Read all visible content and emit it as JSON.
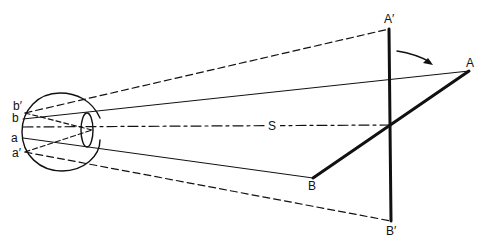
{
  "diagram": {
    "labels": {
      "A_prime": "A′",
      "A": "A",
      "S": "S",
      "B": "B",
      "B_prime": "B′",
      "b_prime": "b′",
      "b": "b",
      "a": "a",
      "a_prime": "a′"
    },
    "colors": {
      "stroke": "#111111",
      "background": "#ffffff"
    }
  }
}
